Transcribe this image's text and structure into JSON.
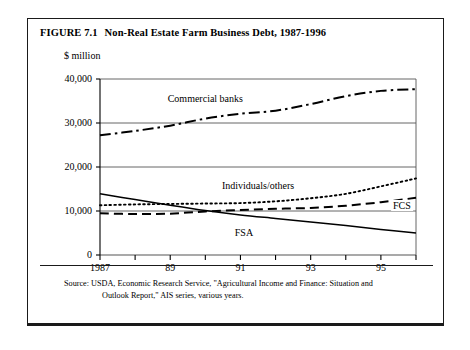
{
  "figure": {
    "number": "FIGURE 7.1",
    "title": "Non-Real Estate Farm Business Debt, 1987-1996",
    "unit_label": "$ million",
    "source_label": "Source:",
    "source_line1": "USDA, Economic Research Service, \"Agricultural Income and Finance: Situation and",
    "source_line2": "Outlook Report,\" AIS series, various years."
  },
  "colors": {
    "ink": "#000000",
    "frame": "#1a1a1a",
    "gridline": "#555555",
    "background": "#ffffff"
  },
  "chart_data": {
    "type": "line",
    "title": "Non-Real Estate Farm Business Debt, 1987-1996",
    "xlabel": "",
    "ylabel": "$ million",
    "x": [
      1987,
      1988,
      1989,
      1990,
      1991,
      1992,
      1993,
      1994,
      1995,
      1996
    ],
    "xtick_labels": [
      "1987",
      "",
      "89",
      "",
      "91",
      "",
      "93",
      "",
      "95",
      ""
    ],
    "xtick_labels_shown": [
      "1987",
      "89",
      "91",
      "93",
      "95"
    ],
    "ytick_labels": [
      "0",
      "10,000",
      "20,000",
      "30,000",
      "40,000"
    ],
    "ytick_values": [
      0,
      10000,
      20000,
      30000,
      40000
    ],
    "ylim": [
      0,
      40000
    ],
    "xlim": [
      1987,
      1996
    ],
    "grid": true,
    "legend": "inline-labels",
    "series": [
      {
        "name": "Commercial banks",
        "style": "dash-dot",
        "label_x": 1990.0,
        "label_y": 35500,
        "values": [
          27200,
          28200,
          29400,
          31000,
          32100,
          32800,
          34300,
          36100,
          37300,
          37700
        ]
      },
      {
        "name": "Individuals/others",
        "style": "dotted",
        "label_x": 1991.5,
        "label_y": 15700,
        "values": [
          11300,
          11500,
          11600,
          11700,
          11800,
          12200,
          12900,
          13900,
          15600,
          17400
        ]
      },
      {
        "name": "FCS",
        "style": "dashed",
        "label_x": 1995.6,
        "label_y": 11200,
        "values": [
          9500,
          9300,
          9400,
          9900,
          10200,
          10500,
          10700,
          11200,
          12000,
          13000
        ]
      },
      {
        "name": "FSA",
        "style": "solid",
        "label_x": 1991.1,
        "label_y": 5100,
        "values": [
          13900,
          12600,
          11300,
          10100,
          9100,
          8300,
          7500,
          6700,
          5800,
          5000
        ]
      }
    ]
  }
}
